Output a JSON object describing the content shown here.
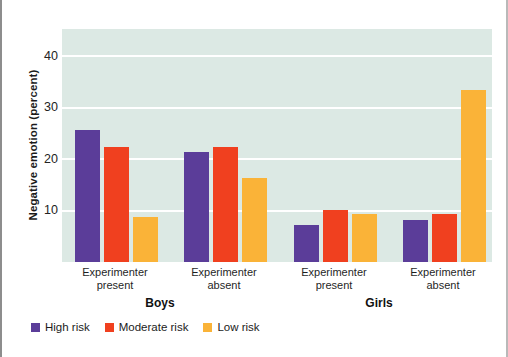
{
  "chart_data": {
    "type": "bar",
    "title": "",
    "xlabel": "",
    "ylabel": "Negative emotion (percent)",
    "ylim": [
      0,
      45
    ],
    "yticks": [
      10,
      20,
      30,
      40
    ],
    "grid": true,
    "legend_position": "bottom-left",
    "groups": [
      {
        "group": "Boys",
        "condition": "Experimenter present"
      },
      {
        "group": "Boys",
        "condition": "Experimenter absent"
      },
      {
        "group": "Girls",
        "condition": "Experimenter present"
      },
      {
        "group": "Girls",
        "condition": "Experimenter absent"
      }
    ],
    "categories": [
      "Boys / Experimenter present",
      "Boys / Experimenter absent",
      "Girls / Experimenter present",
      "Girls / Experimenter absent"
    ],
    "series": [
      {
        "name": "High risk",
        "color": "#5b3d99",
        "values": [
          25.5,
          21.2,
          7.2,
          8.2
        ]
      },
      {
        "name": "Moderate risk",
        "color": "#f0401f",
        "values": [
          22.2,
          22.3,
          10.0,
          9.3
        ]
      },
      {
        "name": "Low risk",
        "color": "#fab338",
        "values": [
          8.6,
          16.2,
          9.2,
          33.2
        ]
      }
    ],
    "plot_background": "#dce9e4",
    "gridline_color": "#ffffff"
  },
  "axes": {
    "y_title": "Negative emotion (percent)",
    "y_ticks": [
      "40",
      "30",
      "20",
      "10"
    ]
  },
  "condition_labels": [
    {
      "line1": "Experimenter",
      "line2": "present"
    },
    {
      "line1": "Experimenter",
      "line2": "absent"
    },
    {
      "line1": "Experimenter",
      "line2": "present"
    },
    {
      "line1": "Experimenter",
      "line2": "absent"
    }
  ],
  "group_labels": [
    "Boys",
    "Girls"
  ],
  "legend": {
    "items": [
      {
        "label": "High risk",
        "color": "#5b3d99"
      },
      {
        "label": "Moderate risk",
        "color": "#f0401f"
      },
      {
        "label": "Low risk",
        "color": "#fab338"
      }
    ]
  }
}
